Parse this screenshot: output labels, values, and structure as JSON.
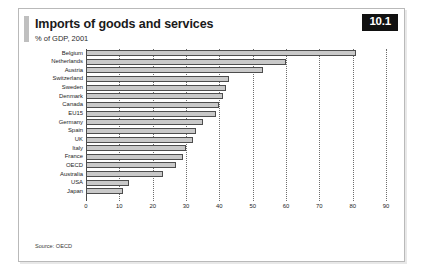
{
  "card": {
    "badge": "10.1",
    "title": "Imports of goods and services",
    "subtitle": "% of GDP, 2001",
    "source": "Source: OECD"
  },
  "chart_data": {
    "type": "bar",
    "orientation": "horizontal",
    "title": "Imports of goods and services",
    "subtitle": "% of GDP, 2001",
    "xlabel": "",
    "ylabel": "",
    "xlim": [
      0,
      90
    ],
    "xticks": [
      0,
      10,
      20,
      30,
      40,
      50,
      60,
      70,
      80,
      90
    ],
    "grid": "vertical-dotted",
    "legend": "none",
    "bar_color": "#c9c9c9",
    "bar_edge_color": "#4d4d4d",
    "categories": [
      "Belgium",
      "Netherlands",
      "Austria",
      "Switzerland",
      "Sweden",
      "Denmark",
      "Canada",
      "EU15",
      "Germany",
      "Spain",
      "UK",
      "Italy",
      "France",
      "OECD",
      "Australia",
      "USA",
      "Japan"
    ],
    "values": [
      81,
      60,
      53,
      43,
      42,
      41,
      40,
      39,
      35,
      33,
      32,
      30,
      29,
      27,
      23,
      13,
      11
    ]
  }
}
